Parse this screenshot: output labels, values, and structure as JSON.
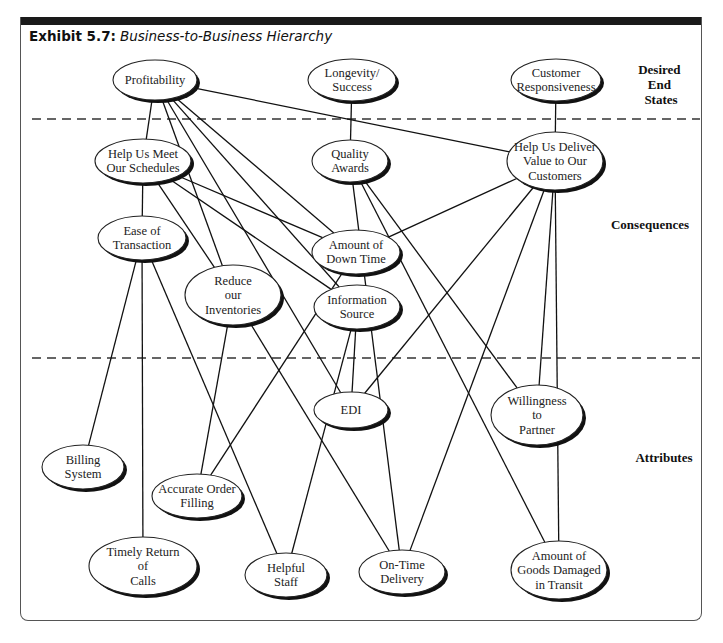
{
  "exhibit": {
    "number_label": "Exhibit 5.7:",
    "title": "Business-to-Business Hierarchy"
  },
  "levels": [
    {
      "id": "desired_end_states",
      "label_lines": [
        "Desired",
        "End",
        "States"
      ]
    },
    {
      "id": "consequences",
      "label_lines": [
        "Consequences"
      ]
    },
    {
      "id": "attributes",
      "label_lines": [
        "Attributes"
      ]
    }
  ],
  "nodes": [
    {
      "id": "profitability",
      "level": "desired_end_states",
      "lines": [
        "Profitability"
      ],
      "cx": 155,
      "cy": 80,
      "rx": 42,
      "ry": 20
    },
    {
      "id": "longevity",
      "level": "desired_end_states",
      "lines": [
        "Longevity/",
        "Success"
      ],
      "cx": 352,
      "cy": 80,
      "rx": 44,
      "ry": 21
    },
    {
      "id": "customer_resp",
      "level": "desired_end_states",
      "lines": [
        "Customer",
        "Responsiveness"
      ],
      "cx": 556,
      "cy": 80,
      "rx": 45,
      "ry": 21
    },
    {
      "id": "meet_schedules",
      "level": "consequences",
      "lines": [
        "Help Us Meet",
        "Our Schedules"
      ],
      "cx": 143,
      "cy": 161,
      "rx": 48,
      "ry": 22
    },
    {
      "id": "quality_awards",
      "level": "consequences",
      "lines": [
        "Quality",
        "Awards"
      ],
      "cx": 350,
      "cy": 161,
      "rx": 38,
      "ry": 21
    },
    {
      "id": "deliver_value",
      "level": "consequences",
      "lines": [
        "Help Us Deliver",
        "Value to Our",
        "Customers"
      ],
      "cx": 555,
      "cy": 161,
      "rx": 48,
      "ry": 29
    },
    {
      "id": "ease_transaction",
      "level": "consequences",
      "lines": [
        "Ease of",
        "Transaction"
      ],
      "cx": 142,
      "cy": 238,
      "rx": 44,
      "ry": 22
    },
    {
      "id": "down_time",
      "level": "consequences",
      "lines": [
        "Amount of",
        "Down Time"
      ],
      "cx": 356,
      "cy": 252,
      "rx": 44,
      "ry": 22
    },
    {
      "id": "reduce_inventories",
      "level": "consequences",
      "lines": [
        "Reduce",
        "our",
        "Inventories"
      ],
      "cx": 233,
      "cy": 295,
      "rx": 48,
      "ry": 30
    },
    {
      "id": "info_source",
      "level": "consequences",
      "lines": [
        "Information",
        "Source"
      ],
      "cx": 357,
      "cy": 307,
      "rx": 43,
      "ry": 22
    },
    {
      "id": "edi",
      "level": "attributes",
      "lines": [
        "EDI"
      ],
      "cx": 351,
      "cy": 410,
      "rx": 37,
      "ry": 18
    },
    {
      "id": "willingness",
      "level": "attributes",
      "lines": [
        "Willingness",
        "to",
        "Partner"
      ],
      "cx": 537,
      "cy": 415,
      "rx": 46,
      "ry": 30
    },
    {
      "id": "billing",
      "level": "attributes",
      "lines": [
        "Billing",
        "System"
      ],
      "cx": 83,
      "cy": 467,
      "rx": 41,
      "ry": 22
    },
    {
      "id": "accurate_order",
      "level": "attributes",
      "lines": [
        "Accurate Order",
        "Filling"
      ],
      "cx": 197,
      "cy": 496,
      "rx": 45,
      "ry": 22
    },
    {
      "id": "timely_return",
      "level": "attributes",
      "lines": [
        "Timely Return",
        "of",
        "Calls"
      ],
      "cx": 143,
      "cy": 566,
      "rx": 54,
      "ry": 29
    },
    {
      "id": "helpful_staff",
      "level": "attributes",
      "lines": [
        "Helpful",
        "Staff"
      ],
      "cx": 286,
      "cy": 575,
      "rx": 41,
      "ry": 22
    },
    {
      "id": "on_time",
      "level": "attributes",
      "lines": [
        "On-Time",
        "Delivery"
      ],
      "cx": 402,
      "cy": 572,
      "rx": 43,
      "ry": 22
    },
    {
      "id": "goods_damaged",
      "level": "attributes",
      "lines": [
        "Amount of",
        "Goods Damaged",
        "in Transit"
      ],
      "cx": 559,
      "cy": 570,
      "rx": 48,
      "ry": 29
    }
  ],
  "edges": [
    [
      "profitability",
      "meet_schedules"
    ],
    [
      "profitability",
      "deliver_value"
    ],
    [
      "profitability",
      "reduce_inventories"
    ],
    [
      "profitability",
      "down_time"
    ],
    [
      "profitability",
      "info_source"
    ],
    [
      "profitability",
      "edi"
    ],
    [
      "longevity",
      "quality_awards"
    ],
    [
      "customer_resp",
      "deliver_value"
    ],
    [
      "meet_schedules",
      "ease_transaction"
    ],
    [
      "meet_schedules",
      "reduce_inventories"
    ],
    [
      "meet_schedules",
      "down_time"
    ],
    [
      "meet_schedules",
      "info_source"
    ],
    [
      "quality_awards",
      "on_time"
    ],
    [
      "quality_awards",
      "goods_damaged"
    ],
    [
      "quality_awards",
      "willingness"
    ],
    [
      "deliver_value",
      "down_time"
    ],
    [
      "deliver_value",
      "edi"
    ],
    [
      "deliver_value",
      "on_time"
    ],
    [
      "deliver_value",
      "willingness"
    ],
    [
      "deliver_value",
      "goods_damaged"
    ],
    [
      "ease_transaction",
      "billing"
    ],
    [
      "ease_transaction",
      "timely_return"
    ],
    [
      "ease_transaction",
      "helpful_staff"
    ],
    [
      "down_time",
      "accurate_order"
    ],
    [
      "reduce_inventories",
      "accurate_order"
    ],
    [
      "reduce_inventories",
      "on_time"
    ],
    [
      "info_source",
      "edi"
    ],
    [
      "info_source",
      "helpful_staff"
    ]
  ],
  "dividers": [
    {
      "y": 119,
      "style": "dashed"
    },
    {
      "y": 358,
      "style": "dashed"
    }
  ]
}
